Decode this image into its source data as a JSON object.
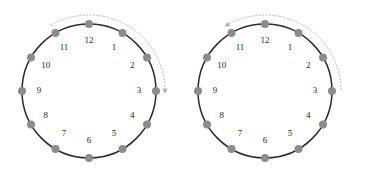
{
  "figure": {
    "title": "",
    "background_color": "#ffffff",
    "width": 372,
    "height": 175
  },
  "style": {
    "circle_stroke_color": "#2b2b2b",
    "dot_color": "#8c8c8c",
    "arc_color": "#b8b8b8",
    "arrow_color": "#b0b0b0",
    "label_color": "#1f1f1f"
  },
  "clocks": [
    {
      "id": "clock-left",
      "name": "clockwise-clock",
      "center_x": 89,
      "center_y": 91,
      "radius": 67,
      "dot_radius": 4,
      "label_radius": 50,
      "hour_labels": [
        "12",
        "1",
        "2",
        "3",
        "4",
        "5",
        "6",
        "7",
        "8",
        "9",
        "10",
        "11"
      ],
      "arrow": {
        "direction": "clockwise",
        "arc_radius": 76,
        "start_hour": 11,
        "end_hour": 3,
        "head_at_hour": 3,
        "head_label": "clockwise-arrowhead"
      }
    },
    {
      "id": "clock-right",
      "name": "counterclockwise-clock",
      "center_x": 265,
      "center_y": 91,
      "radius": 67,
      "dot_radius": 4,
      "label_radius": 50,
      "hour_labels": [
        "12",
        "1",
        "2",
        "3",
        "4",
        "5",
        "6",
        "7",
        "8",
        "9",
        "10",
        "11"
      ],
      "arrow": {
        "direction": "counterclockwise",
        "arc_radius": 76,
        "start_hour": 3,
        "end_hour": 11,
        "head_at_hour": 11,
        "head_label": "counterclockwise-arrowhead"
      }
    }
  ]
}
